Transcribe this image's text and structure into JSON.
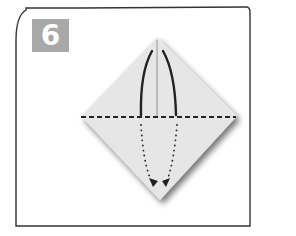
{
  "step": {
    "number": "6",
    "badge_color": "#a8a8a8",
    "text_color": "#ffffff"
  },
  "diagram": {
    "shape": "diamond",
    "paper_color": "#e6e6e6",
    "outline_color": "#3a3a3a",
    "icons": [
      "valley-fold-line",
      "center-crease-line",
      "curved-fold-arrow-left",
      "curved-fold-arrow-right",
      "dotted-arrow-left",
      "dotted-arrow-right"
    ]
  }
}
